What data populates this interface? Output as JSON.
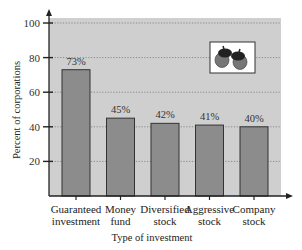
{
  "chart_data": {
    "type": "bar",
    "title": "",
    "xlabel": "Type of investment",
    "ylabel": "Percent of corporations",
    "categories": [
      [
        "Guaranteed",
        "investment"
      ],
      [
        "Money",
        "fund"
      ],
      [
        "Diversified",
        "stock"
      ],
      [
        "Aggressive",
        "stock"
      ],
      [
        "Company",
        "stock"
      ]
    ],
    "values": [
      73,
      45,
      42,
      41,
      40
    ],
    "value_labels": [
      "73%",
      "45%",
      "42%",
      "41%",
      "40%"
    ],
    "ylim": [
      0,
      100
    ],
    "yticks": [
      20,
      40,
      60,
      80,
      100
    ],
    "grid": true,
    "legend": null,
    "decoration": "acorns-icon",
    "colors": {
      "plot_background": "#cfcfcf",
      "bar_fill": "#8c8c8c",
      "bar_stroke": "#333333",
      "grid": "#777777",
      "axis": "#222222"
    }
  }
}
